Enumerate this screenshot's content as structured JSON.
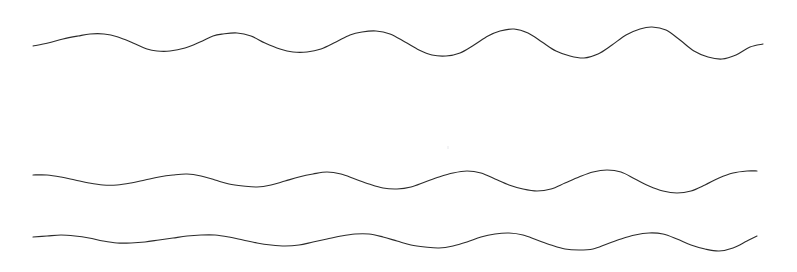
{
  "figure": {
    "title": "",
    "background_color": "#ffffff",
    "width": 797,
    "height": 272
  },
  "chart_data": {
    "type": "line",
    "title": "",
    "subtitle": "",
    "xlabel": "",
    "ylabel": "",
    "xlim": [
      0,
      797
    ],
    "ylim": [
      272,
      0
    ],
    "grid": false,
    "legend": "none",
    "axes_visible": false,
    "tick_labels_x": [],
    "tick_labels_y": [],
    "annotations": [],
    "line_color": "#2b2b2b",
    "line_width": 1.15,
    "series": [
      {
        "name": "wave-top",
        "stroke": "#2b2b2b",
        "x_start": 33,
        "x_end": 763,
        "baseline_y": 43,
        "wavelength": 140,
        "amplitude_start": 7,
        "amplitude_end": 15,
        "points": [
          [
            33,
            46
          ],
          [
            48,
            43
          ],
          [
            63,
            39
          ],
          [
            78,
            36
          ],
          [
            90,
            34
          ],
          [
            104,
            34
          ],
          [
            118,
            37
          ],
          [
            133,
            43
          ],
          [
            147,
            49
          ],
          [
            157,
            51
          ],
          [
            170,
            51
          ],
          [
            185,
            48
          ],
          [
            200,
            42
          ],
          [
            213,
            36
          ],
          [
            223,
            34
          ],
          [
            237,
            33
          ],
          [
            251,
            36
          ],
          [
            265,
            43
          ],
          [
            280,
            49
          ],
          [
            293,
            52
          ],
          [
            307,
            52
          ],
          [
            321,
            49
          ],
          [
            336,
            42
          ],
          [
            350,
            35
          ],
          [
            362,
            32
          ],
          [
            376,
            31
          ],
          [
            390,
            34
          ],
          [
            405,
            42
          ],
          [
            419,
            50
          ],
          [
            432,
            55
          ],
          [
            446,
            56
          ],
          [
            460,
            53
          ],
          [
            474,
            45
          ],
          [
            488,
            36
          ],
          [
            500,
            31
          ],
          [
            514,
            29
          ],
          [
            528,
            33
          ],
          [
            542,
            42
          ],
          [
            556,
            51
          ],
          [
            570,
            56
          ],
          [
            584,
            58
          ],
          [
            598,
            54
          ],
          [
            612,
            45
          ],
          [
            626,
            35
          ],
          [
            640,
            29
          ],
          [
            652,
            27
          ],
          [
            666,
            30
          ],
          [
            680,
            40
          ],
          [
            694,
            51
          ],
          [
            708,
            57
          ],
          [
            722,
            59
          ],
          [
            736,
            55
          ],
          [
            750,
            47
          ],
          [
            763,
            44
          ]
        ]
      },
      {
        "name": "wave-middle",
        "stroke": "#2b2b2b",
        "x_start": 33,
        "x_end": 757,
        "baseline_y": 180,
        "wavelength": 135,
        "amplitude_start": 4,
        "amplitude_end": 11,
        "points": [
          [
            33,
            175
          ],
          [
            47,
            175
          ],
          [
            61,
            177
          ],
          [
            75,
            180
          ],
          [
            89,
            183
          ],
          [
            103,
            185
          ],
          [
            117,
            185
          ],
          [
            131,
            183
          ],
          [
            145,
            180
          ],
          [
            159,
            177
          ],
          [
            173,
            175
          ],
          [
            187,
            174
          ],
          [
            201,
            176
          ],
          [
            215,
            180
          ],
          [
            229,
            184
          ],
          [
            243,
            186
          ],
          [
            257,
            187
          ],
          [
            271,
            185
          ],
          [
            285,
            181
          ],
          [
            299,
            177
          ],
          [
            313,
            174
          ],
          [
            327,
            172
          ],
          [
            341,
            174
          ],
          [
            355,
            179
          ],
          [
            369,
            184
          ],
          [
            383,
            188
          ],
          [
            397,
            189
          ],
          [
            411,
            187
          ],
          [
            425,
            182
          ],
          [
            439,
            177
          ],
          [
            453,
            173
          ],
          [
            467,
            171
          ],
          [
            481,
            173
          ],
          [
            495,
            179
          ],
          [
            509,
            185
          ],
          [
            523,
            189
          ],
          [
            537,
            191
          ],
          [
            551,
            189
          ],
          [
            565,
            183
          ],
          [
            579,
            177
          ],
          [
            593,
            172
          ],
          [
            607,
            170
          ],
          [
            621,
            172
          ],
          [
            635,
            179
          ],
          [
            649,
            186
          ],
          [
            663,
            191
          ],
          [
            677,
            193
          ],
          [
            691,
            191
          ],
          [
            705,
            185
          ],
          [
            719,
            178
          ],
          [
            733,
            173
          ],
          [
            747,
            171
          ],
          [
            757,
            171
          ]
        ]
      },
      {
        "name": "wave-bottom",
        "stroke": "#2b2b2b",
        "x_start": 33,
        "x_end": 757,
        "baseline_y": 239,
        "wavelength": 145,
        "amplitude_start": 3,
        "amplitude_end": 9,
        "points": [
          [
            33,
            237
          ],
          [
            47,
            236
          ],
          [
            61,
            235
          ],
          [
            75,
            236
          ],
          [
            89,
            238
          ],
          [
            103,
            241
          ],
          [
            117,
            243
          ],
          [
            131,
            243
          ],
          [
            145,
            242
          ],
          [
            159,
            240
          ],
          [
            173,
            238
          ],
          [
            187,
            236
          ],
          [
            201,
            235
          ],
          [
            215,
            235
          ],
          [
            229,
            237
          ],
          [
            243,
            240
          ],
          [
            257,
            243
          ],
          [
            271,
            245
          ],
          [
            285,
            246
          ],
          [
            299,
            245
          ],
          [
            313,
            242
          ],
          [
            327,
            239
          ],
          [
            341,
            236
          ],
          [
            355,
            234
          ],
          [
            369,
            234
          ],
          [
            383,
            237
          ],
          [
            397,
            241
          ],
          [
            411,
            245
          ],
          [
            425,
            247
          ],
          [
            439,
            248
          ],
          [
            453,
            246
          ],
          [
            467,
            242
          ],
          [
            481,
            237
          ],
          [
            495,
            234
          ],
          [
            509,
            233
          ],
          [
            523,
            235
          ],
          [
            537,
            240
          ],
          [
            551,
            245
          ],
          [
            565,
            249
          ],
          [
            579,
            250
          ],
          [
            593,
            249
          ],
          [
            607,
            244
          ],
          [
            621,
            239
          ],
          [
            635,
            235
          ],
          [
            649,
            233
          ],
          [
            663,
            234
          ],
          [
            677,
            239
          ],
          [
            691,
            245
          ],
          [
            705,
            249
          ],
          [
            719,
            251
          ],
          [
            733,
            248
          ],
          [
            747,
            241
          ],
          [
            757,
            236
          ]
        ]
      }
    ]
  }
}
